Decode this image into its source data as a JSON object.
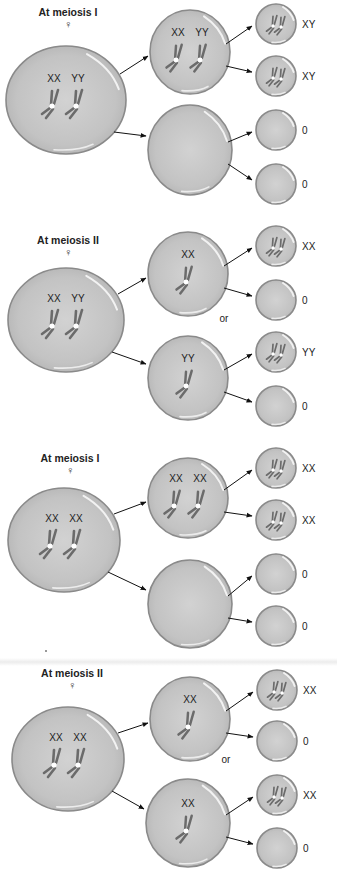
{
  "panels": [
    {
      "title": "At meiosis I",
      "sex_symbol": "♀",
      "parent": {
        "labels": [
          "XX",
          "YY"
        ]
      },
      "daughters": [
        {
          "labels": [
            "XX",
            "YY"
          ],
          "has_chromosomes": true
        },
        {
          "labels": [],
          "has_chromosomes": false
        }
      ],
      "gametes": [
        "XY",
        "XY",
        "0",
        "0"
      ],
      "or_label": ""
    },
    {
      "title": "At meiosis II",
      "sex_symbol": "♀",
      "parent": {
        "labels": [
          "XX",
          "YY"
        ]
      },
      "daughters": [
        {
          "labels": [
            "XX"
          ],
          "has_chromosomes": true
        },
        {
          "labels": [
            "YY"
          ],
          "has_chromosomes": true
        }
      ],
      "gametes": [
        "XX",
        "0",
        "YY",
        "0"
      ],
      "or_label": "or"
    },
    {
      "title": "At meiosis I",
      "sex_symbol": "♀",
      "parent": {
        "labels": [
          "XX",
          "XX"
        ]
      },
      "daughters": [
        {
          "labels": [
            "XX",
            "XX"
          ],
          "has_chromosomes": true
        },
        {
          "labels": [],
          "has_chromosomes": false
        }
      ],
      "gametes": [
        "XX",
        "XX",
        "0",
        "0"
      ],
      "or_label": ""
    },
    {
      "title": "At meiosis II",
      "sex_symbol": "♀",
      "parent": {
        "labels": [
          "XX",
          "XX"
        ]
      },
      "daughters": [
        {
          "labels": [
            "XX"
          ],
          "has_chromosomes": true
        },
        {
          "labels": [
            "XX"
          ],
          "has_chromosomes": true
        }
      ],
      "gametes": [
        "XX",
        "0",
        "XX",
        "0"
      ],
      "or_label": "or"
    }
  ],
  "colors": {
    "cell_fill": "#c4c4c4",
    "cell_outline": "#8a8a8a",
    "chromosome": "#6b6b6b",
    "centromere": "#ffffff",
    "arrow": "#111111"
  }
}
